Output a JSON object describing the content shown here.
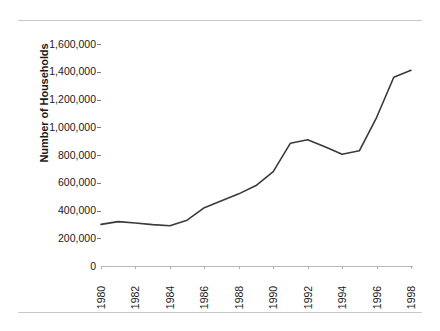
{
  "page": {
    "rules": [
      "top-rule",
      "bottom-rule"
    ]
  },
  "chart_data": {
    "type": "line",
    "title": "",
    "subtitle": "",
    "xlabel": "",
    "ylabel": "Number of Households",
    "xlim": [
      1980,
      1998
    ],
    "ylim": [
      0,
      1600000
    ],
    "grid": false,
    "legend": null,
    "legend_position": "none",
    "line_color": "#3a3a3a",
    "y_ticks": [
      0,
      200000,
      400000,
      600000,
      800000,
      1000000,
      1200000,
      1400000,
      1600000
    ],
    "y_tick_labels": [
      "0",
      "200,000",
      "400,000",
      "600,000",
      "800,000",
      "1,000,000",
      "1,200,000",
      "1,400,000",
      "1,600,000"
    ],
    "x_ticks": [
      1980,
      1982,
      1984,
      1986,
      1988,
      1990,
      1992,
      1994,
      1996,
      1998
    ],
    "x_tick_labels": [
      "1980",
      "1982",
      "1984",
      "1986",
      "1988",
      "1990",
      "1992",
      "1994",
      "1996",
      "1998"
    ],
    "x_tick_rotation": -90,
    "x": [
      1980,
      1981,
      1982,
      1983,
      1984,
      1985,
      1986,
      1987,
      1988,
      1989,
      1990,
      1991,
      1992,
      1993,
      1994,
      1995,
      1996,
      1997,
      1998
    ],
    "values": [
      300000,
      320000,
      310000,
      298000,
      290000,
      330000,
      420000,
      470000,
      520000,
      580000,
      680000,
      885000,
      910000,
      860000,
      805000,
      830000,
      1070000,
      1360000,
      1410000
    ],
    "series": [
      {
        "name": "Number of Households",
        "values": [
          300000,
          320000,
          310000,
          298000,
          290000,
          330000,
          420000,
          470000,
          520000,
          580000,
          680000,
          885000,
          910000,
          860000,
          805000,
          830000,
          1070000,
          1360000,
          1410000
        ]
      }
    ]
  }
}
